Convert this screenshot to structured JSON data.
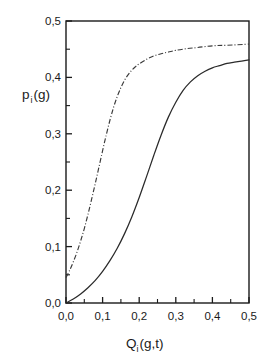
{
  "chart_data": {
    "type": "line",
    "title": "",
    "xlabel": "Q_i(g,t)",
    "ylabel": "p_i(g)",
    "xlim": [
      0.0,
      0.5
    ],
    "ylim": [
      0.0,
      0.5
    ],
    "grid": false,
    "legend": "none",
    "xticks": [
      "0,0",
      "0,1",
      "0,2",
      "0,3",
      "0,4",
      "0,5"
    ],
    "xtick_values": [
      0.0,
      0.1,
      0.2,
      0.3,
      0.4,
      0.5
    ],
    "yticks": [
      "0,0",
      "0,1",
      "0,2",
      "0,3",
      "0,4",
      "0,5"
    ],
    "ytick_values": [
      0.0,
      0.1,
      0.2,
      0.3,
      0.4,
      0.5
    ],
    "minor_tick_step": 0.05,
    "series": [
      {
        "name": "dash-dot-curve",
        "style": "dashdot",
        "color": "#3a3a3a",
        "x": [
          0.0,
          0.01,
          0.02,
          0.03,
          0.04,
          0.05,
          0.06,
          0.07,
          0.08,
          0.09,
          0.1,
          0.11,
          0.12,
          0.13,
          0.14,
          0.15,
          0.16,
          0.17,
          0.18,
          0.19,
          0.2,
          0.22,
          0.24,
          0.26,
          0.28,
          0.3,
          0.33,
          0.36,
          0.4,
          0.44,
          0.5
        ],
        "values": [
          0.045,
          0.058,
          0.073,
          0.09,
          0.11,
          0.132,
          0.157,
          0.184,
          0.212,
          0.241,
          0.27,
          0.298,
          0.324,
          0.347,
          0.366,
          0.382,
          0.395,
          0.405,
          0.413,
          0.419,
          0.424,
          0.432,
          0.438,
          0.442,
          0.445,
          0.448,
          0.451,
          0.453,
          0.456,
          0.457,
          0.459
        ]
      },
      {
        "name": "solid-curve",
        "style": "solid",
        "color": "#2a2a2a",
        "x": [
          0.0,
          0.02,
          0.04,
          0.06,
          0.08,
          0.1,
          0.12,
          0.14,
          0.16,
          0.18,
          0.2,
          0.22,
          0.24,
          0.26,
          0.28,
          0.3,
          0.32,
          0.34,
          0.36,
          0.38,
          0.4,
          0.42,
          0.44,
          0.46,
          0.48,
          0.5
        ],
        "values": [
          0.0,
          0.007,
          0.016,
          0.027,
          0.04,
          0.056,
          0.075,
          0.097,
          0.123,
          0.153,
          0.187,
          0.224,
          0.262,
          0.298,
          0.33,
          0.356,
          0.377,
          0.392,
          0.403,
          0.411,
          0.417,
          0.421,
          0.425,
          0.427,
          0.429,
          0.431
        ]
      }
    ]
  },
  "labels": {
    "ylabel_base": "p",
    "ylabel_sub": "i",
    "ylabel_rest": "(g)",
    "xlabel_base": "Q",
    "xlabel_sub": "i",
    "xlabel_rest": "(g,t)"
  },
  "colors": {
    "frame": "#1a1a1a",
    "background": "#ffffff",
    "solid_curve": "#2a2a2a",
    "dashdot_curve": "#3a3a3a"
  }
}
